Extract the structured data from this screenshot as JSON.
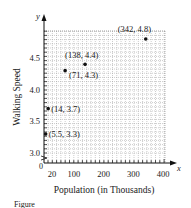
{
  "chart_data": {
    "type": "scatter",
    "title": "",
    "xlabel": "Population (in Thousands)",
    "ylabel": "Walking Speed",
    "x_axis_letter": "x",
    "y_axis_letter": "y",
    "origin_label": "0",
    "xlim": [
      0,
      400
    ],
    "ylim": [
      3.0,
      4.9
    ],
    "axis_break_y": true,
    "grid": true,
    "x_ticks": [
      {
        "value": 20,
        "label": "20"
      },
      {
        "value": 100,
        "label": "100"
      },
      {
        "value": 200,
        "label": "200"
      },
      {
        "value": 300,
        "label": "300"
      },
      {
        "value": 400,
        "label": "400"
      }
    ],
    "y_ticks": [
      {
        "value": 3.0,
        "label": "3.0"
      },
      {
        "value": 3.5,
        "label": "3.5"
      },
      {
        "value": 4.0,
        "label": "4.0"
      },
      {
        "value": 4.5,
        "label": "4.5"
      }
    ],
    "points": [
      {
        "x": 5.5,
        "y": 3.3,
        "label": "(5.5, 3.3)"
      },
      {
        "x": 14,
        "y": 3.7,
        "label": "(14, 3.7)"
      },
      {
        "x": 71,
        "y": 4.3,
        "label": "(71, 4.3)"
      },
      {
        "x": 138,
        "y": 4.4,
        "label": "(138, 4.4)"
      },
      {
        "x": 342,
        "y": 4.8,
        "label": "(342, 4.8)"
      }
    ],
    "legend": null
  },
  "caption_fragment": "Figure"
}
